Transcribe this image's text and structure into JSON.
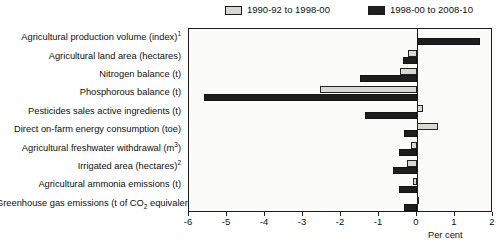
{
  "legend": {
    "position": "top",
    "entries": [
      {
        "label": "1990-92 to 1998-00",
        "swatch": "light-square-icon",
        "color": "#d6d6d2"
      },
      {
        "label": "1998-00 to 2008-10",
        "swatch": "dark-square-icon",
        "color": "#1f1f1f"
      }
    ]
  },
  "axis": {
    "x_title": "Per cent",
    "ticks": [
      "-6",
      "-5",
      "-4",
      "-3",
      "-2",
      "-1",
      "0",
      "1",
      "2"
    ]
  },
  "chart_data": {
    "type": "bar",
    "orientation": "horizontal",
    "title": "",
    "xlabel": "Per cent",
    "ylabel": "",
    "xlim": [
      -6,
      2
    ],
    "grid": false,
    "legend_position": "top",
    "categories": [
      "Agricultural production volume (index)¹",
      "Agricultural land area (hectares)",
      "Nitrogen balance (t)",
      "Phosphorous balance (t)",
      "Pesticides sales active ingredients (t)",
      "Direct on-farm energy consumption (toe)",
      "Agricultural freshwater withdrawal (m³)",
      "Irrigated area (hectares)²",
      "Agricultural ammonia emissions (t)",
      "Greenhouse gas emissions (t of CO₂ equivalent)"
    ],
    "categories_html": [
      "Agricultural production volume (index)<sup>1</sup>",
      "Agricultural land area (hectares)",
      "Nitrogen balance (t)",
      "Phosphorous balance (t)",
      "Pesticides sales active ingredients (t)",
      "Direct on-farm energy consumption (toe)",
      "Agricultural freshwater withdrawal (m<sup>3</sup>)",
      "Irrigated area (hectares)<sup>2</sup>",
      "Agricultural ammonia emissions (t)",
      "Greenhouse gas emissions (t of CO<sub>2</sub> equivalent)"
    ],
    "series": [
      {
        "name": "1990-92 to 1998-00",
        "color": "#d6d6d2",
        "values": [
          0.0,
          -0.23,
          -0.45,
          -2.55,
          0.15,
          0.55,
          -0.17,
          -0.27,
          -0.1,
          0.05
        ]
      },
      {
        "name": "1998-00 to 2008-10",
        "color": "#1f1f1f",
        "values": [
          1.65,
          -0.38,
          -1.5,
          -5.6,
          -1.37,
          -0.35,
          -0.47,
          -0.63,
          -0.47,
          -0.35
        ]
      }
    ]
  }
}
